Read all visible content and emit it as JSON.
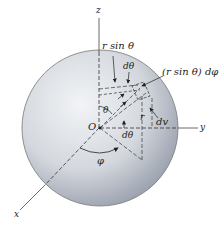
{
  "diagram": {
    "labels": {
      "z_axis": "z",
      "y_axis": "y",
      "x_axis": "x",
      "origin": "O",
      "r_sin_theta": "r sin θ",
      "d_theta_top": "dθ",
      "r_sin_theta_dphi": "(r sin θ) dφ",
      "theta": "θ",
      "r": "r",
      "dv": "dv",
      "d_theta_bottom": "dθ",
      "phi": "φ"
    },
    "colors": {
      "sphere_light": "#eef0f3",
      "sphere_dark": "#9aa0ad",
      "line": "#333333",
      "background": "#ffffff"
    }
  }
}
